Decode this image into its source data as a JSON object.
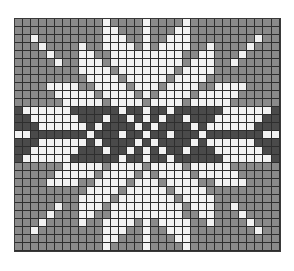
{
  "chart": {
    "title": "",
    "type": "knitting-chart",
    "cols": 33,
    "rows": 29,
    "legend": {
      "G": {
        "name": "background",
        "color": "#8a8a8a"
      },
      "W": {
        "name": "star",
        "color": "#f2f2f2"
      },
      "D": {
        "name": "band",
        "color": "#4a4a4a"
      }
    },
    "quadrant_rows": [
      "GGGGGGGGGGGWGGGGW",
      "GGGGGGGGGGGWWGGGW",
      "GGWGGGGGGGGWWWGGW",
      "GGGWGGGGWGGWWWWGW",
      "GGGGWGGGWWGGWWWWW",
      "GGGGGWGGWWWGWWWWW",
      "GGGGGGGGWWWWGWWWW",
      "GGGGGGGGGWWWWGWWW",
      "GGGGWWWWGGWWWWGWW",
      "GGGGGWWWWWGWWWWGW",
      "GGGGGGWWWWWGWWWWG",
      "DWWWWWWDDDDDDWDDW",
      "DDWWWWWWDDDWDDWDW",
      "DDDWWWWWWDWDDDDWD",
      "WWDDDDDDDWDDDWDDW"
    ]
  }
}
